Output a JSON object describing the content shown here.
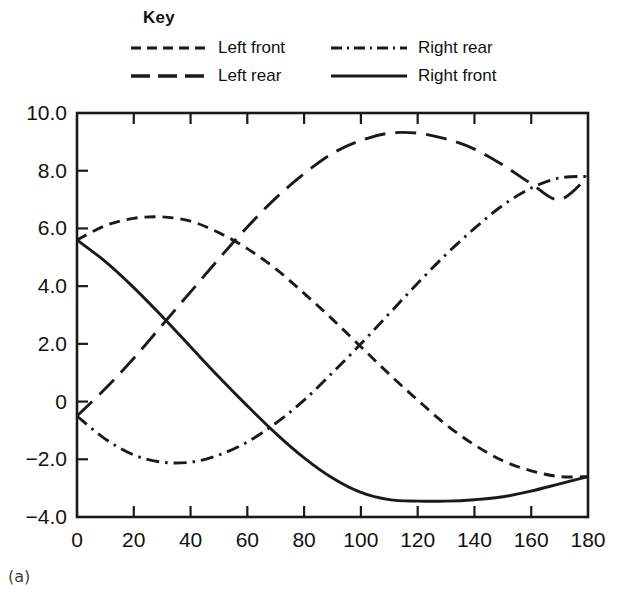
{
  "legend": {
    "title": "Key",
    "entries": [
      {
        "label": "Left front",
        "style": "short-dash",
        "column": 0,
        "row": 0
      },
      {
        "label": "Right rear",
        "style": "dash-dot",
        "column": 1,
        "row": 0
      },
      {
        "label": "Left rear",
        "style": "long-dash",
        "column": 0,
        "row": 1
      },
      {
        "label": "Right front",
        "style": "solid",
        "column": 1,
        "row": 1
      }
    ]
  },
  "caption": "(a)",
  "colors": {
    "line": "#1a1a1a",
    "axis": "#1a1a1a",
    "background": "#ffffff",
    "caption": "#3c3c3c"
  },
  "chart_data": {
    "type": "line",
    "title": "",
    "xlabel": "",
    "ylabel": "",
    "xlim": [
      0,
      180
    ],
    "ylim": [
      -4.0,
      10.0
    ],
    "xticks": [
      0,
      20,
      40,
      60,
      80,
      100,
      120,
      140,
      160,
      180
    ],
    "xtick_labels": [
      "0",
      "20",
      "40",
      "60",
      "80",
      "100",
      "120",
      "140",
      "160",
      "180"
    ],
    "yticks": [
      -4.0,
      -2.0,
      0,
      2.0,
      4.0,
      6.0,
      8.0,
      10.0
    ],
    "ytick_labels": [
      "-4.0",
      "-2.0",
      "0",
      "2.0",
      "4.0",
      "6.0",
      "8.0",
      "10.0"
    ],
    "grid": false,
    "frame": "box",
    "tick_direction": "in",
    "legend_position": "above-plot",
    "x": [
      0,
      10,
      20,
      30,
      40,
      50,
      60,
      70,
      80,
      90,
      100,
      110,
      120,
      130,
      140,
      150,
      160,
      170,
      180
    ],
    "series": [
      {
        "name": "Left front",
        "style": "short-dash",
        "values": [
          5.6,
          6.1,
          6.35,
          6.4,
          6.25,
          5.85,
          5.3,
          4.6,
          3.75,
          2.85,
          1.9,
          0.95,
          0.05,
          -0.8,
          -1.5,
          -2.05,
          -2.4,
          -2.6,
          -2.6
        ]
      },
      {
        "name": "Left rear",
        "style": "long-dash",
        "values": [
          -0.5,
          0.45,
          1.5,
          2.65,
          3.8,
          4.95,
          6.05,
          7.05,
          7.9,
          8.6,
          9.05,
          9.3,
          9.3,
          9.1,
          8.75,
          8.2,
          7.55,
          7.0,
          7.8
        ]
      },
      {
        "name": "Right rear",
        "style": "dash-dot",
        "values": [
          -0.5,
          -1.3,
          -1.85,
          -2.1,
          -2.1,
          -1.85,
          -1.4,
          -0.75,
          0.05,
          1.0,
          2.0,
          3.05,
          4.1,
          5.1,
          6.0,
          6.8,
          7.4,
          7.75,
          7.8
        ]
      },
      {
        "name": "Right front",
        "style": "solid",
        "values": [
          5.6,
          4.85,
          3.95,
          2.95,
          1.9,
          0.85,
          -0.15,
          -1.1,
          -1.95,
          -2.65,
          -3.15,
          -3.4,
          -3.45,
          -3.45,
          -3.4,
          -3.3,
          -3.1,
          -2.85,
          -2.6
        ]
      }
    ]
  }
}
